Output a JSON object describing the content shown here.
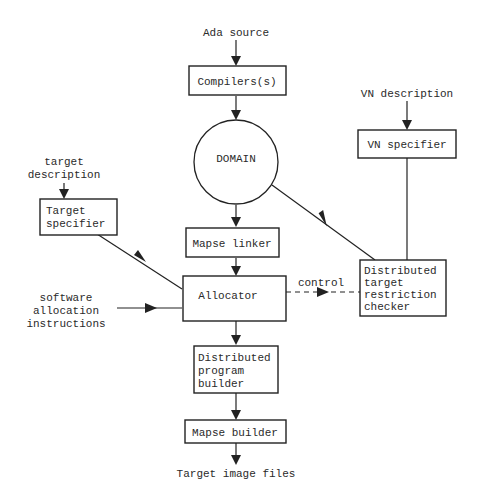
{
  "diagram": {
    "type": "flowchart",
    "inputs": {
      "ada_source": "Ada source",
      "target_description": [
        "target",
        "description"
      ],
      "vn_description": "VN description",
      "software_allocation": [
        "software",
        "allocation",
        "instructions"
      ]
    },
    "nodes": {
      "compilers": [
        "Compilers(s)"
      ],
      "domain": [
        "DOMAIN"
      ],
      "vn_specifier": [
        "VN specifier"
      ],
      "target_specifier": [
        "Target",
        "specifier"
      ],
      "mapse_linker": [
        "Mapse linker"
      ],
      "allocator": [
        "Allocator"
      ],
      "dtrc": [
        "Distributed",
        "target",
        "restriction",
        "checker"
      ],
      "dpb": [
        "Distributed",
        "program",
        "builder"
      ],
      "mapse_builder": [
        "Mapse builder"
      ]
    },
    "edge_labels": {
      "control": "control"
    },
    "output": "Target image files",
    "edges": [
      {
        "from": "Ada source",
        "to": "Compilers(s)"
      },
      {
        "from": "Compilers(s)",
        "to": "DOMAIN"
      },
      {
        "from": "DOMAIN",
        "to": "Mapse linker"
      },
      {
        "from": "DOMAIN",
        "to": "Distributed target restriction checker"
      },
      {
        "from": "VN description",
        "to": "VN specifier"
      },
      {
        "from": "VN specifier",
        "to": "Distributed target restriction checker"
      },
      {
        "from": "target description",
        "to": "Target specifier"
      },
      {
        "from": "Target specifier",
        "to": "Allocator"
      },
      {
        "from": "Mapse linker",
        "to": "Allocator"
      },
      {
        "from": "software allocation instructions",
        "to": "Allocator"
      },
      {
        "from": "Allocator",
        "to": "Distributed target restriction checker",
        "label": "control",
        "style": "dashed"
      },
      {
        "from": "Allocator",
        "to": "Distributed program builder"
      },
      {
        "from": "Distributed program builder",
        "to": "Mapse builder"
      },
      {
        "from": "Mapse builder",
        "to": "Target image files"
      }
    ]
  }
}
